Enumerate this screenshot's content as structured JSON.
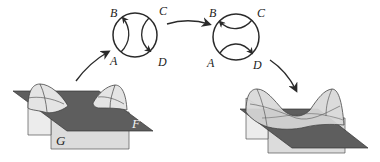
{
  "diagram": {
    "type": "surface-reconnection",
    "colors": {
      "ink": "#2a2a2a",
      "plane_F": "#5e5e5e",
      "plane_G": "#dcdcdc",
      "surface_light": "#e6e6e6",
      "surface_mid": "#cfcfcf",
      "background": "#ffffff"
    },
    "circle_before": {
      "labels": {
        "top_left": "B",
        "top_right": "C",
        "bottom_left": "A",
        "bottom_right": "D"
      },
      "description": "arcs A→B and C→D (vertical pairing)"
    },
    "circle_after": {
      "labels": {
        "top_left": "B",
        "top_right": "C",
        "bottom_left": "A",
        "bottom_right": "D"
      },
      "description": "arcs C→B and A→D (horizontal pairing)"
    },
    "surface_before": {
      "plane_labels": {
        "upper": "F",
        "lower": "G"
      }
    },
    "surface_after": {
      "plane_labels": {
        "upper": "",
        "lower": ""
      }
    },
    "arrows": [
      {
        "from": "surface_before",
        "to": "circle_before"
      },
      {
        "from": "circle_before",
        "to": "circle_after"
      },
      {
        "from": "circle_after",
        "to": "surface_after"
      }
    ]
  }
}
